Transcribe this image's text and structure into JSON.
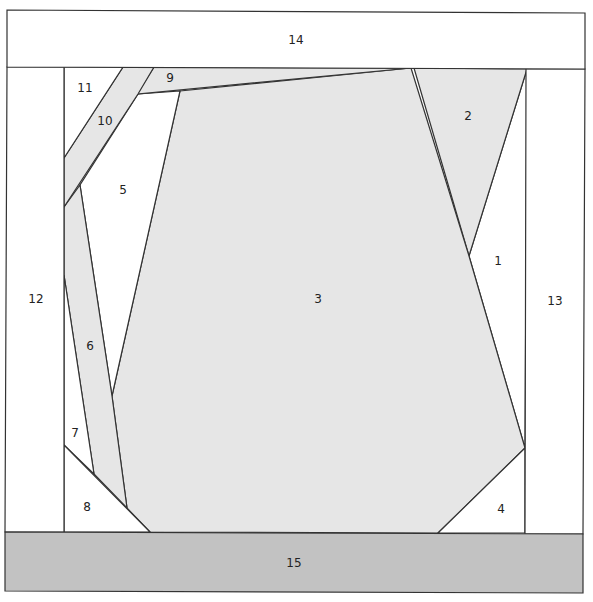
{
  "diagram": {
    "type": "foundation paper piecing pattern",
    "colors": {
      "white": "#ffffff",
      "light_gray": "#e6e6e6",
      "dark_gray": "#c2c2c2",
      "line": "#333333"
    },
    "pieces": [
      {
        "id": "1",
        "label": "1",
        "fill": "white",
        "points": "469,256 527,69 525,448",
        "label_pos": [
          498,
          261
        ]
      },
      {
        "id": "2",
        "label": "2",
        "fill": "light_gray",
        "points": "414,68 527,69 469,256",
        "label_pos": [
          468,
          116
        ]
      },
      {
        "id": "3",
        "label": "3",
        "fill": "light_gray",
        "points": "180,91 411,68 469,256 525,448 438,533 150,532 127,508 112,396",
        "label_pos": [
          318,
          299
        ]
      },
      {
        "id": "4",
        "label": "4",
        "fill": "white",
        "points": "525,448 525,533 438,533",
        "label_pos": [
          501,
          509
        ]
      },
      {
        "id": "5",
        "label": "5",
        "fill": "white",
        "points": "138,94 180,91 112,396 80,185",
        "label_pos": [
          123,
          190
        ]
      },
      {
        "id": "6",
        "label": "6",
        "fill": "light_gray",
        "points": "80,185 112,396 127,508 94,474 64,275 64,207",
        "label_pos": [
          90,
          346
        ]
      },
      {
        "id": "7",
        "label": "7",
        "fill": "white",
        "points": "64,275 94,474 64,445",
        "label_pos": [
          75,
          433
        ]
      },
      {
        "id": "8",
        "label": "8",
        "fill": "white",
        "points": "64,445 150,532 64,532",
        "label_pos": [
          87,
          507
        ]
      },
      {
        "id": "9",
        "label": "9",
        "fill": "light_gray",
        "points": "154,67 411,68 137,94",
        "label_pos": [
          170,
          78
        ]
      },
      {
        "id": "10",
        "label": "10",
        "fill": "light_gray",
        "points": "123,67 154,67 138,94 64,207 64,158",
        "label_pos": [
          105,
          121
        ]
      },
      {
        "id": "11",
        "label": "11",
        "fill": "white",
        "points": "64,67 123,67 64,158",
        "label_pos": [
          85,
          88
        ]
      },
      {
        "id": "12",
        "label": "12",
        "fill": "white",
        "points": "7,67 64,67 64,532 5,532",
        "label_pos": [
          36,
          299
        ]
      },
      {
        "id": "13",
        "label": "13",
        "fill": "white",
        "points": "526,69 585,69 583,534 525,534",
        "label_pos": [
          555,
          301
        ]
      },
      {
        "id": "14",
        "label": "14",
        "fill": "white",
        "points": "7,10 585,13 585,69 7,67",
        "label_pos": [
          296,
          40
        ]
      },
      {
        "id": "15",
        "label": "15",
        "fill": "dark_gray",
        "points": "5,532 583,534 583,593 5,591",
        "label_pos": [
          294,
          563
        ]
      }
    ]
  }
}
